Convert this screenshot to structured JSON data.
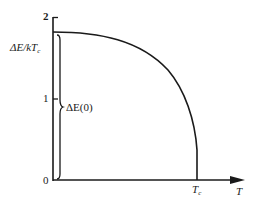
{
  "diagram": {
    "type": "energy-gap-vs-temperature",
    "y_axis": {
      "label_main": "ΔE/kT",
      "label_sub": "c",
      "ticks": [
        "2",
        "1",
        "0"
      ]
    },
    "x_axis": {
      "label": "T",
      "tick_main": "T",
      "tick_sub": "c"
    },
    "brace_label": "ΔE(0)",
    "colors": {
      "line": "#1a1a1a",
      "background": "#ffffff"
    }
  }
}
